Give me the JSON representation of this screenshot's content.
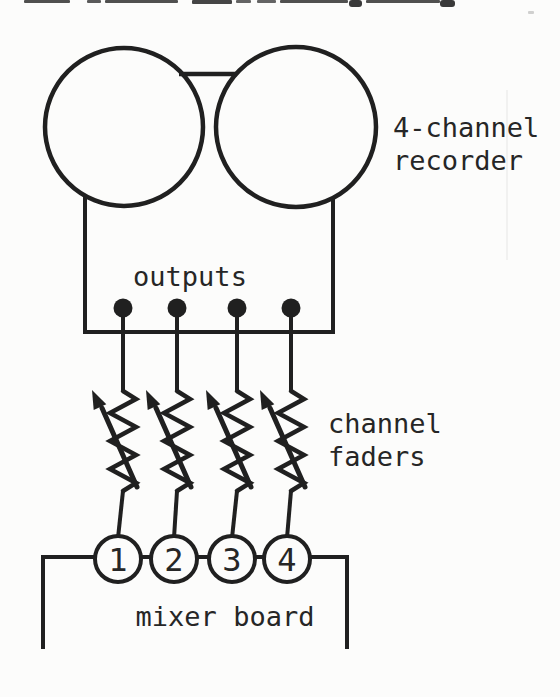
{
  "labels": {
    "recorder": {
      "line1": "4-channel",
      "line2": "recorder"
    },
    "outputs": "outputs",
    "faders": {
      "line1": "channel",
      "line2": "faders"
    },
    "mixer": "mixer board"
  },
  "channels": [
    "1",
    "2",
    "3",
    "4"
  ],
  "colors": {
    "ink": "#202020",
    "paper": "#fcfcfb"
  }
}
